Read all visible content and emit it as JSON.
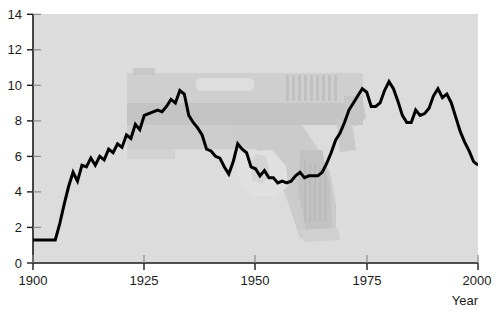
{
  "chart_data": {
    "type": "line",
    "title": "",
    "subtitle": "",
    "xlabel": "Year",
    "ylabel": "",
    "xlim": [
      1900,
      2000
    ],
    "ylim": [
      0,
      14
    ],
    "grid": false,
    "legend": null,
    "x_ticks": [
      1900,
      1925,
      1950,
      1975,
      2000
    ],
    "x_tick_labels": [
      "1900",
      "1925",
      "1950",
      "1975",
      "2000"
    ],
    "y_ticks": [
      0,
      2,
      4,
      6,
      8,
      10,
      12,
      14
    ],
    "y_tick_labels": [
      "0",
      "2",
      "4",
      "6",
      "8",
      "10",
      "12",
      "14"
    ],
    "series": [
      {
        "name": "rate",
        "color": "#000000",
        "line_width": 3,
        "x": [
          1900,
          1901,
          1902,
          1903,
          1904,
          1905,
          1906,
          1907,
          1908,
          1909,
          1910,
          1911,
          1912,
          1913,
          1914,
          1915,
          1916,
          1917,
          1918,
          1919,
          1920,
          1921,
          1922,
          1923,
          1924,
          1925,
          1926,
          1927,
          1928,
          1929,
          1930,
          1931,
          1932,
          1933,
          1934,
          1935,
          1936,
          1937,
          1938,
          1939,
          1940,
          1941,
          1942,
          1943,
          1944,
          1945,
          1946,
          1947,
          1948,
          1949,
          1950,
          1951,
          1952,
          1953,
          1954,
          1955,
          1956,
          1957,
          1958,
          1959,
          1960,
          1961,
          1962,
          1963,
          1964,
          1965,
          1966,
          1967,
          1968,
          1969,
          1970,
          1971,
          1972,
          1973,
          1974,
          1975,
          1976,
          1977,
          1978,
          1979,
          1980,
          1981,
          1982,
          1983,
          1984,
          1985,
          1986,
          1987,
          1988,
          1989,
          1990,
          1991,
          1992,
          1993,
          1994,
          1995,
          1996,
          1997,
          1998,
          1999,
          2000
        ],
        "y": [
          1.3,
          1.3,
          1.3,
          1.3,
          1.3,
          1.3,
          2.2,
          3.3,
          4.3,
          5.1,
          4.6,
          5.5,
          5.4,
          5.9,
          5.5,
          6.0,
          5.8,
          6.4,
          6.2,
          6.7,
          6.5,
          7.2,
          7.0,
          7.8,
          7.5,
          8.3,
          8.4,
          8.5,
          8.6,
          8.5,
          8.8,
          9.2,
          9.0,
          9.7,
          9.5,
          8.3,
          7.9,
          7.6,
          7.2,
          6.4,
          6.3,
          6.0,
          5.9,
          5.4,
          5.0,
          5.7,
          6.7,
          6.4,
          6.2,
          5.4,
          5.3,
          4.9,
          5.2,
          4.8,
          4.8,
          4.5,
          4.6,
          4.5,
          4.6,
          4.9,
          5.1,
          4.8,
          4.9,
          4.9,
          4.9,
          5.1,
          5.6,
          6.2,
          6.9,
          7.3,
          7.9,
          8.6,
          9.0,
          9.4,
          9.8,
          9.6,
          8.8,
          8.8,
          9.0,
          9.7,
          10.2,
          9.8,
          9.1,
          8.3,
          7.9,
          7.9,
          8.6,
          8.3,
          8.4,
          8.7,
          9.4,
          9.8,
          9.3,
          9.5,
          9.0,
          8.2,
          7.4,
          6.8,
          6.3,
          5.7,
          5.5
        ]
      }
    ],
    "annotations": [
      {
        "name": "pistol-watermark",
        "type": "background-image",
        "description": "semi-transparent gray handgun silhouette"
      }
    ],
    "colors": {
      "plot_background": "#dcdcdc",
      "page_background": "#ffffff",
      "line": "#000000",
      "axis": "#1a1a1a",
      "watermark": "#c6c6c6"
    }
  },
  "axes": {
    "x_axis_title": "Year"
  }
}
